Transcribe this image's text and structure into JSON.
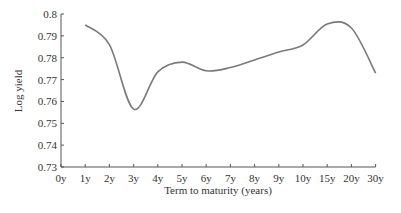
{
  "chart_data": {
    "type": "line",
    "title": "",
    "xlabel": "Term to maturity (years)",
    "ylabel": "Log yield",
    "x": [
      "0y",
      "1y",
      "2y",
      "3y",
      "4y",
      "5y",
      "6y",
      "7y",
      "8y",
      "9y",
      "10y",
      "15y",
      "20y",
      "30y"
    ],
    "series": [
      {
        "name": "Log yield",
        "x": [
          "1y",
          "2y",
          "3y",
          "4y",
          "5y",
          "6y",
          "7y",
          "8y",
          "9y",
          "10y",
          "15y",
          "20y",
          "30y"
        ],
        "values": [
          0.795,
          0.786,
          0.7565,
          0.7735,
          0.778,
          0.774,
          0.7755,
          0.779,
          0.7826,
          0.7858,
          0.7954,
          0.7936,
          0.773
        ]
      }
    ],
    "ylim": [
      0.73,
      0.8
    ],
    "yticks": [
      "0.73",
      "0.74",
      "0.75",
      "0.76",
      "0.77",
      "0.78",
      "0.79",
      "0.8"
    ],
    "grid": false,
    "legend": null,
    "line_color": "#7a7a7a"
  }
}
